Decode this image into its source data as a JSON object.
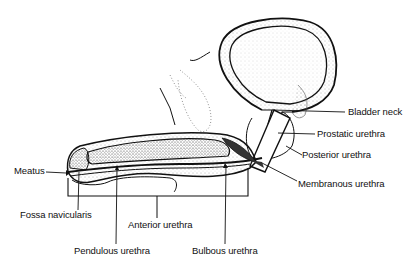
{
  "diagram": {
    "labels": {
      "bladder_neck": "Bladder neck",
      "prostatic_urethra": "Prostatic urethra",
      "posterior_urethra": "Posterior urethra",
      "membranous_urethra": "Membranous urethra",
      "meatus": "Meatus",
      "fossa_navicularis": "Fossa navicularis",
      "anterior_urethra": "Anterior urethra",
      "pendulous_urethra": "Pendulous urethra",
      "bulbous_urethra": "Bulbous urethra"
    },
    "colors": {
      "ink": "#111111",
      "background": "#ffffff",
      "stipple": "#555555"
    }
  }
}
